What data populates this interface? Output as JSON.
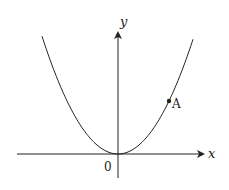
{
  "diagram": {
    "type": "parabola-graph",
    "axes": {
      "x_label": "x",
      "y_label": "y",
      "origin_label": "0"
    },
    "curve": {
      "description": "upward parabola with vertex at origin",
      "vertex": [
        118,
        154
      ],
      "k": 0.0204,
      "x_range": [
        42,
        193
      ]
    },
    "points": [
      {
        "label": "A",
        "px": [
          169,
          101
        ]
      }
    ],
    "colors": {
      "stroke": "#222222",
      "background": "#ffffff"
    }
  }
}
